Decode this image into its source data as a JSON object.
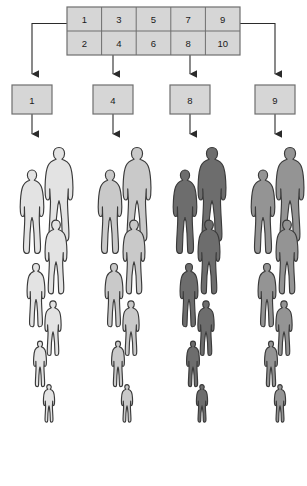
{
  "diagram": {
    "colors": {
      "box_fill": "#d6d6d6",
      "box_stroke": "#6e6e6e",
      "arrow": "#2b2b2b",
      "group_1_fill": "#e3e3e3",
      "group_2_fill": "#c9c9c9",
      "group_3_fill": "#6d6d6d",
      "group_4_fill": "#949494",
      "figure_stroke": "#3a3a3a",
      "background": "#ffffff"
    }
  },
  "frame_table": {
    "rows": [
      [
        "1",
        "3",
        "5",
        "7",
        "9"
      ],
      [
        "2",
        "4",
        "6",
        "8",
        "10"
      ]
    ]
  },
  "selected_boxes": [
    {
      "label": "1"
    },
    {
      "label": "4"
    },
    {
      "label": "8"
    },
    {
      "label": "9"
    }
  ],
  "population_groups": [
    {
      "selection_label": "1",
      "shade": "#e3e3e3",
      "figure_count": 7
    },
    {
      "selection_label": "4",
      "shade": "#c9c9c9",
      "figure_count": 7
    },
    {
      "selection_label": "8",
      "shade": "#6d6d6d",
      "figure_count": 7
    },
    {
      "selection_label": "9",
      "shade": "#949494",
      "figure_count": 7
    }
  ]
}
